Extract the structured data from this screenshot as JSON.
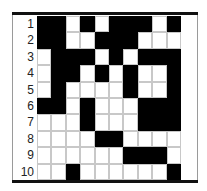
{
  "puzzle": {
    "type": "nonogram-grid",
    "row_labels": [
      "1",
      "2",
      "3",
      "4",
      "5",
      "6",
      "7",
      "8",
      "9",
      "10"
    ],
    "colors": {
      "filled": "#000000",
      "empty": "#ffffff",
      "gridline": "#c8c8c8",
      "frame": "#111111"
    },
    "rows": [
      [
        1,
        1,
        0,
        1,
        0,
        1,
        1,
        1,
        0,
        1
      ],
      [
        1,
        1,
        0,
        0,
        1,
        1,
        1,
        0,
        0,
        0
      ],
      [
        0,
        1,
        1,
        1,
        0,
        1,
        0,
        1,
        1,
        1
      ],
      [
        0,
        1,
        1,
        0,
        1,
        0,
        1,
        0,
        0,
        1
      ],
      [
        0,
        1,
        0,
        0,
        0,
        0,
        1,
        0,
        0,
        1
      ],
      [
        1,
        1,
        0,
        1,
        0,
        0,
        0,
        1,
        1,
        1
      ],
      [
        0,
        0,
        0,
        1,
        0,
        0,
        0,
        1,
        1,
        1
      ],
      [
        0,
        0,
        0,
        0,
        1,
        1,
        0,
        0,
        0,
        0
      ],
      [
        0,
        0,
        0,
        0,
        0,
        0,
        1,
        1,
        1,
        0
      ],
      [
        0,
        0,
        1,
        0,
        0,
        0,
        0,
        0,
        0,
        1
      ]
    ]
  }
}
